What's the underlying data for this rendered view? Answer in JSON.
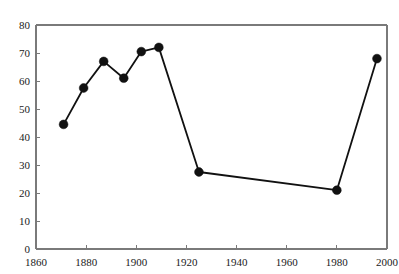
{
  "chart_data": {
    "type": "line",
    "title": "",
    "subtitle": "",
    "xlabel": "",
    "ylabel": "",
    "xlim": [
      1860,
      2000
    ],
    "ylim": [
      0,
      80
    ],
    "x_ticks": [
      1860,
      1880,
      1900,
      1920,
      1940,
      1960,
      1980,
      2000
    ],
    "y_ticks": [
      0,
      10,
      20,
      30,
      40,
      50,
      60,
      70,
      80
    ],
    "x_tick_labels": [
      "1860",
      "1880",
      "1900",
      "1920",
      "1940",
      "1960",
      "1980",
      "2000"
    ],
    "y_tick_labels": [
      "0",
      "10",
      "20",
      "30",
      "40",
      "50",
      "60",
      "70",
      "80"
    ],
    "grid": false,
    "legend": null,
    "legend_position": "none",
    "marker": "filled-circle",
    "marker_color": "#111111",
    "line_color": "#111111",
    "axis_color": "#7a7a7a",
    "background_color": "#ffffff",
    "x": [
      1871,
      1879,
      1887,
      1895,
      1902,
      1909,
      1925,
      1980,
      1996
    ],
    "values": [
      44.5,
      57.5,
      67,
      61,
      70.5,
      72,
      27.5,
      21,
      68
    ],
    "series": [
      {
        "name": "series-1",
        "x": [
          1871,
          1879,
          1887,
          1895,
          1902,
          1909,
          1925,
          1980,
          1996
        ],
        "values": [
          44.5,
          57.5,
          67,
          61,
          70.5,
          72,
          27.5,
          21,
          68
        ]
      }
    ],
    "annotations": []
  }
}
